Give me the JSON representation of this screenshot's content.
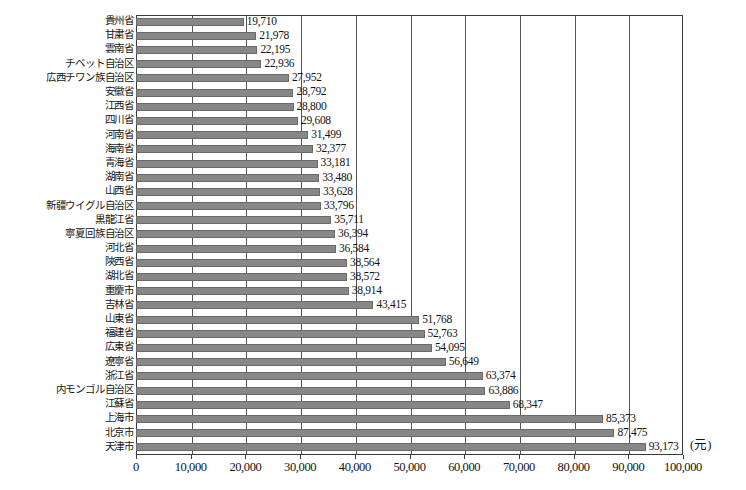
{
  "chart_data": {
    "type": "bar",
    "orientation": "horizontal",
    "title": "",
    "xlabel": "",
    "ylabel": "",
    "unit_label": "(元)",
    "xlim": [
      0,
      100000
    ],
    "xticks": [
      0,
      10000,
      20000,
      30000,
      40000,
      50000,
      60000,
      70000,
      80000,
      90000,
      100000
    ],
    "xtick_labels": [
      "0",
      "10,000",
      "20,000",
      "30,000",
      "40,000",
      "50,000",
      "60,000",
      "70,000",
      "80,000",
      "90,000",
      "100,000"
    ],
    "grid": true,
    "legend": "none",
    "bar_color": "#878787",
    "categories": [
      "貴州省",
      "甘粛省",
      "雲南省",
      "チベット自治区",
      "広西チワン族自治区",
      "安徽省",
      "江西省",
      "四川省",
      "河南省",
      "海南省",
      "青海省",
      "湖南省",
      "山西省",
      "新疆ウイグル自治区",
      "黒龍江省",
      "寧夏回族自治区",
      "河北省",
      "陝西省",
      "湖北省",
      "重慶市",
      "吉林省",
      "山東省",
      "福建省",
      "広東省",
      "遼寧省",
      "浙江省",
      "内モンゴル自治区",
      "江蘇省",
      "上海市",
      "北京市",
      "天津市"
    ],
    "values": [
      19710,
      21978,
      22195,
      22936,
      27952,
      28792,
      28800,
      29608,
      31499,
      32377,
      33181,
      33480,
      33628,
      33796,
      35711,
      36394,
      36584,
      38564,
      38572,
      38914,
      43415,
      51768,
      52763,
      54095,
      56649,
      63374,
      63886,
      68347,
      85373,
      87475,
      93173
    ],
    "value_labels": [
      "19,710",
      "21,978",
      "22,195",
      "22,936",
      "27,952",
      "28,792",
      "28,800",
      "29,608",
      "31,499",
      "32,377",
      "33,181",
      "33,480",
      "33,628",
      "33,796",
      "35,711",
      "36,394",
      "36,584",
      "38,564",
      "38,572",
      "38,914",
      "43,415",
      "51,768",
      "52,763",
      "54,095",
      "56,649",
      "63,374",
      "63,886",
      "68,347",
      "85,373",
      "87,475",
      "93,173"
    ]
  }
}
